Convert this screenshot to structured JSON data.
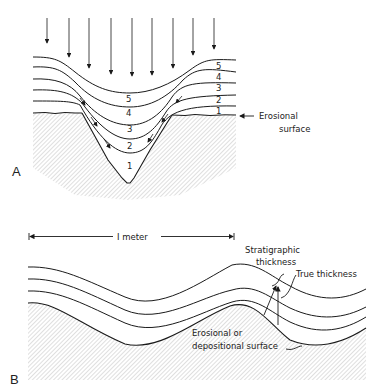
{
  "panel_a": {
    "letter": "A",
    "layer_numbers_right": [
      "5",
      "4",
      "3",
      "2",
      "1"
    ],
    "layer_numbers_trough": [
      "5",
      "4",
      "3",
      "2",
      "1"
    ],
    "erosional_label_line1": "Erosional",
    "erosional_label_line2": "surface"
  },
  "panel_b": {
    "letter": "B",
    "scale_label": "I meter",
    "stratigraphic_line1": "Stratigraphic",
    "stratigraphic_line2": "thickness",
    "true_thickness": "True thickness",
    "surface_line1": "Erosional  or",
    "surface_line2": "depositional  surface"
  },
  "colors": {
    "line": "#1a1a1a",
    "hatch": "#bdbdbd",
    "background": "#ffffff"
  }
}
